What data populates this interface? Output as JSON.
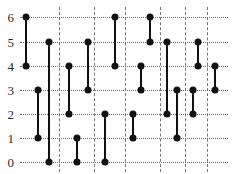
{
  "chart_data": {
    "type": "segments",
    "title": "",
    "xlabel": "",
    "ylabel": "",
    "grid": true,
    "legend": null,
    "ylim": [
      0,
      6
    ],
    "y_ticks": [
      0,
      1,
      2,
      3,
      4,
      5,
      6
    ],
    "y_tick_labels": [
      "0",
      "1",
      "2",
      "3",
      "4",
      "5",
      "6"
    ],
    "x_ticks": [],
    "x_tick_labels": [],
    "vertical_gridlines_px": [
      59,
      94,
      125,
      160,
      185,
      207
    ],
    "n_segments": 16,
    "series": [
      {
        "name": "vertical segments",
        "segments": [
          {
            "index": 1,
            "x_px": 26,
            "y_top": 6,
            "y_bottom": 4
          },
          {
            "index": 2,
            "x_px": 38,
            "y_top": 3,
            "y_bottom": 1
          },
          {
            "index": 3,
            "x_px": 49,
            "y_top": 5,
            "y_bottom": 0
          },
          {
            "index": 4,
            "x_px": 69,
            "y_top": 4,
            "y_bottom": 2
          },
          {
            "index": 5,
            "x_px": 77,
            "y_top": 1,
            "y_bottom": 0
          },
          {
            "index": 6,
            "x_px": 88,
            "y_top": 5,
            "y_bottom": 3
          },
          {
            "index": 7,
            "x_px": 105,
            "y_top": 2,
            "y_bottom": 0
          },
          {
            "index": 8,
            "x_px": 115,
            "y_top": 6,
            "y_bottom": 4
          },
          {
            "index": 9,
            "x_px": 133,
            "y_top": 2,
            "y_bottom": 1
          },
          {
            "index": 10,
            "x_px": 141,
            "y_top": 4,
            "y_bottom": 3
          },
          {
            "index": 11,
            "x_px": 150,
            "y_top": 6,
            "y_bottom": 5
          },
          {
            "index": 12,
            "x_px": 167,
            "y_top": 5,
            "y_bottom": 2
          },
          {
            "index": 13,
            "x_px": 177,
            "y_top": 3,
            "y_bottom": 1
          },
          {
            "index": 14,
            "x_px": 193,
            "y_top": 3,
            "y_bottom": 2
          },
          {
            "index": 15,
            "x_px": 198,
            "y_top": 5,
            "y_bottom": 4
          },
          {
            "index": 16,
            "x_px": 215,
            "y_top": 4,
            "y_bottom": 3
          }
        ]
      }
    ],
    "colors": {
      "segment": "#111111",
      "endpoint": "#111111",
      "grid": "#555555",
      "tick_label": "#2b2b2b",
      "background": "#ffffff"
    }
  },
  "geometry": {
    "plot_left_px": 20,
    "plot_right_px": 228,
    "row_y_px": {
      "0": 162,
      "1": 138,
      "2": 114,
      "3": 90,
      "4": 66,
      "5": 42,
      "6": 17
    }
  }
}
